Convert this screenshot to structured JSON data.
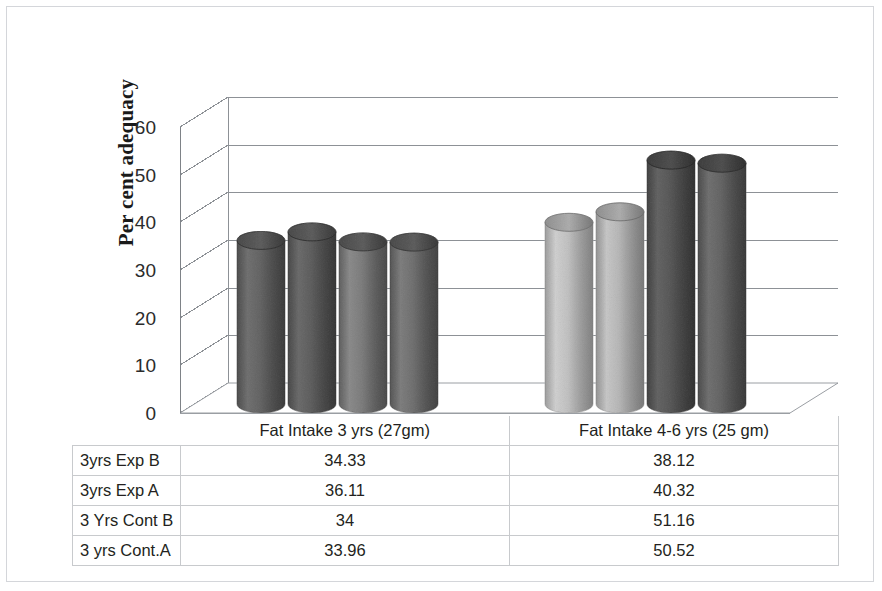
{
  "chart_data": {
    "type": "bar",
    "title": "",
    "xlabel": "",
    "ylabel": "Per cent adequacy",
    "ylim": [
      0,
      60
    ],
    "yticks": [
      0,
      10,
      20,
      30,
      40,
      50,
      60
    ],
    "grid": true,
    "legend": "none",
    "three_d": true,
    "bar_shape": "cylinder",
    "categories": [
      "Fat Intake 3 yrs (27gm)",
      "Fat Intake 4-6 yrs (25 gm)"
    ],
    "series": [
      {
        "name": "3yrs Exp B",
        "values": [
          34.33,
          38.12
        ],
        "color": "#9a9a9a"
      },
      {
        "name": "3yrs Exp A",
        "values": [
          36.11,
          40.32
        ],
        "color": "#8f8f8f"
      },
      {
        "name": "3 Yrs Cont B",
        "values": [
          34,
          51.16
        ],
        "color": "#adadad"
      },
      {
        "name": "3 yrs Cont.A",
        "values": [
          33.96,
          50.52
        ],
        "color": "#a3a3a3"
      }
    ]
  },
  "axis": {
    "y_title": "Per cent adequacy",
    "ticks": [
      "60",
      "50",
      "40",
      "30",
      "20",
      "10",
      "0"
    ]
  },
  "table": {
    "header": [
      "",
      "Fat Intake 3 yrs (27gm)",
      "Fat Intake 4-6 yrs (25 gm)"
    ],
    "rows": [
      {
        "label": "3yrs Exp B",
        "v1": "34.33",
        "v2": "38.12"
      },
      {
        "label": "3yrs Exp A",
        "v1": "36.11",
        "v2": "40.32"
      },
      {
        "label": "3 Yrs Cont B",
        "v1": "34",
        "v2": "51.16"
      },
      {
        "label": "3 yrs Cont.A",
        "v1": "33.96",
        "v2": "50.52"
      }
    ]
  },
  "colors": {
    "cyl_group1": [
      "#9b9b9b",
      "#939393",
      "#a8a8a8",
      "#9f9f9f"
    ],
    "cyl_group2": [
      "#d9d9d9",
      "#d2d2d2",
      "#919191",
      "#9a9a9a"
    ],
    "grid": "#8d9196",
    "frame": "#d4d6da",
    "text": "#231f20"
  }
}
